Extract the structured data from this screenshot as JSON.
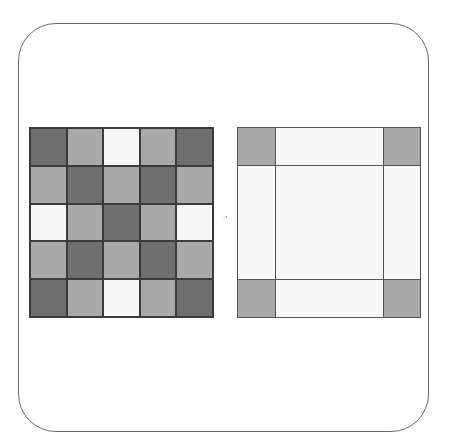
{
  "colors": {
    "dark": "#6f6f6f",
    "mid": "#a9a9a9",
    "light": "#f6f6f6",
    "border": "#3a3a3a",
    "frame": "#6a6a6a"
  },
  "left_grid": {
    "rows": 5,
    "cols": 5,
    "pattern": [
      [
        "dark",
        "mid",
        "light",
        "mid",
        "dark"
      ],
      [
        "mid",
        "dark",
        "mid",
        "dark",
        "mid"
      ],
      [
        "light",
        "mid",
        "dark",
        "mid",
        "light"
      ],
      [
        "mid",
        "dark",
        "mid",
        "dark",
        "mid"
      ],
      [
        "dark",
        "mid",
        "light",
        "mid",
        "dark"
      ]
    ]
  },
  "right_grid": {
    "corner_color": "mid",
    "edge_color": "light",
    "center_color": "light",
    "layout": "3x3 with narrow corners: corners gray, edges and center white"
  },
  "arrow": {
    "direction": "right",
    "from": "left_grid",
    "to": "right_grid"
  }
}
